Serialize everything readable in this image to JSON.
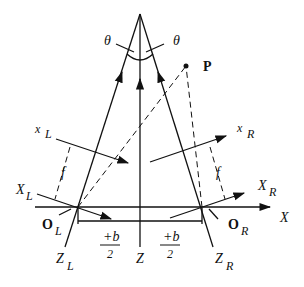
{
  "diagram": {
    "type": "stereo-camera-geometry",
    "labels": {
      "theta_left": "θ",
      "theta_right": "θ",
      "point": "P",
      "x_left_main": "x",
      "x_left_sub": "L",
      "x_right_main": "x",
      "x_right_sub": "R",
      "X_left_main": "X",
      "X_left_sub": "L",
      "X_right_main": "X",
      "X_right_sub": "R",
      "f_left": "f",
      "f_right": "f",
      "O_left_main": "O",
      "O_left_sub": "L",
      "O_right_main": "O",
      "O_right_sub": "R",
      "X_axis": "X",
      "Z_left_main": "Z",
      "Z_left_sub": "L",
      "Z_center": "Z",
      "Z_right_main": "Z",
      "Z_right_sub": "R",
      "half_baseline_left_num": "+b",
      "half_baseline_left_den": "2",
      "half_baseline_right_num": "+b",
      "half_baseline_right_den": "2"
    },
    "colors": {
      "stroke": "#111111",
      "background": "#ffffff"
    }
  }
}
